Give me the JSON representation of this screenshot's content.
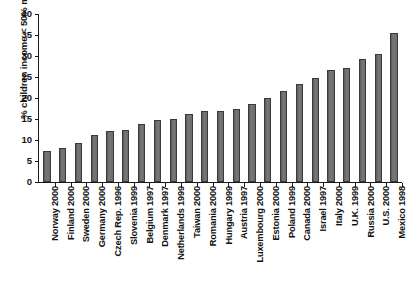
{
  "chart_data": {
    "type": "bar",
    "title": "",
    "subtitle": "",
    "xlabel": "",
    "ylabel": "% children income < 50% median",
    "ylim": [
      0,
      40
    ],
    "ytick_labels": [
      "0",
      "5",
      "10",
      "15",
      "20",
      "25",
      "30",
      "35",
      "40"
    ],
    "ytick_values": [
      0,
      5,
      10,
      15,
      20,
      25,
      30,
      35,
      40
    ],
    "grid": false,
    "legend": null,
    "bar_color": "#6e6e6e",
    "bar_edge_color": "#3a3a3a",
    "categories": [
      "Norway 2000",
      "Finland 2000",
      "Sweden 2000",
      "Germany 2000",
      "Czech Rep. 1996",
      "Slovenia 1999",
      "Belgium 1997",
      "Denmark 1997",
      "Netherlands 1999",
      "Taiwan 2000",
      "Romania 2000",
      "Hungary 1999",
      "Austria 1997",
      "Luxembourg 2000",
      "Estonia 2000",
      "Poland 1999",
      "Canada 2000",
      "Israel 1997",
      "Italy 2000",
      "U.K. 1999",
      "Russia 2000",
      "U.S. 2000",
      "Mexico 1998"
    ],
    "values": [
      7.5,
      8.1,
      9.3,
      11.2,
      12.2,
      12.3,
      13.9,
      14.7,
      15.0,
      16.2,
      16.8,
      16.8,
      17.5,
      18.5,
      20.1,
      21.7,
      23.4,
      24.8,
      26.7,
      27.2,
      29.2,
      30.4,
      35.4
    ]
  }
}
